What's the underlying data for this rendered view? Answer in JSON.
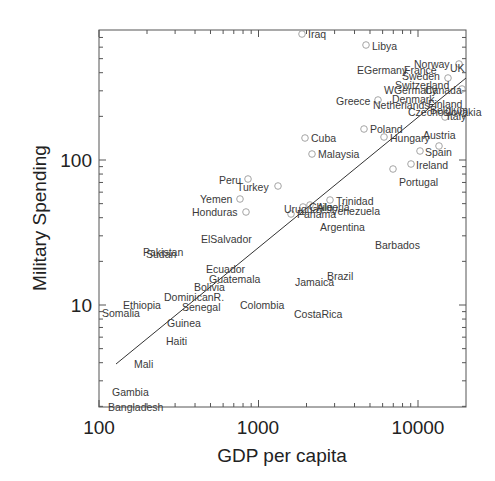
{
  "chart_data": {
    "type": "scatter",
    "title": "",
    "xlabel": "GDP per capita",
    "ylabel": "Military Spending",
    "xscale": "log",
    "yscale": "log",
    "xlim": [
      100,
      20000
    ],
    "ylim": [
      2,
      790
    ],
    "xticks": [
      100,
      1000,
      10000
    ],
    "xtick_labels": [
      "100",
      "1000",
      "10000"
    ],
    "yticks": [
      10,
      100
    ],
    "ytick_labels": [
      "10",
      "100"
    ],
    "grid": false,
    "legend": null,
    "fit_line": {
      "x": [
        126,
        20000
      ],
      "y": [
        4,
        245
      ]
    },
    "points": [
      {
        "label": "Iraq",
        "gdp": 1950,
        "mil": 780,
        "marker": true
      },
      {
        "label": "Libya",
        "gdp": 4900,
        "mil": 580,
        "marker": true
      },
      {
        "label": "EGermany",
        "gdp": 8500,
        "mil": 390,
        "marker": false
      },
      {
        "label": "Norway",
        "gdp": 14000,
        "mil": 420,
        "marker": false
      },
      {
        "label": "France",
        "gdp": 12000,
        "mil": 380,
        "marker": false
      },
      {
        "label": "UK",
        "gdp": 17000,
        "mil": 390,
        "marker": true
      },
      {
        "label": "Sweden",
        "gdp": 15500,
        "mil": 350,
        "marker": true
      },
      {
        "label": "Switzerland",
        "gdp": 16000,
        "mil": 310,
        "marker": false
      },
      {
        "label": "WGermany",
        "gdp": 13000,
        "mil": 290,
        "marker": false
      },
      {
        "label": "Canada",
        "gdp": 17500,
        "mil": 285,
        "marker": true
      },
      {
        "label": "Greece",
        "gdp": 6000,
        "mil": 250,
        "marker": true
      },
      {
        "label": "Denmark",
        "gdp": 13000,
        "mil": 255,
        "marker": false
      },
      {
        "label": "Netherlands",
        "gdp": 11500,
        "mil": 230,
        "marker": false
      },
      {
        "label": "Finland",
        "gdp": 14500,
        "mil": 225,
        "marker": false
      },
      {
        "label": "Czechoslovakia",
        "gdp": 12000,
        "mil": 215,
        "marker": false
      },
      {
        "label": "Belgium",
        "gdp": 15000,
        "mil": 210,
        "marker": false
      },
      {
        "label": "Italy",
        "gdp": 15500,
        "mil": 195,
        "marker": true
      },
      {
        "label": "Poland",
        "gdp": 4800,
        "mil": 165,
        "marker": true
      },
      {
        "label": "Hungary",
        "gdp": 6800,
        "mil": 150,
        "marker": true
      },
      {
        "label": "Austria",
        "gdp": 13500,
        "mil": 125,
        "marker": true
      },
      {
        "label": "Cuba",
        "gdp": 1980,
        "mil": 145,
        "marker": true
      },
      {
        "label": "Malaysia",
        "gdp": 2200,
        "mil": 112,
        "marker": true
      },
      {
        "label": "Spain",
        "gdp": 10500,
        "mil": 115,
        "marker": true
      },
      {
        "label": "Ireland",
        "gdp": 9300,
        "mil": 95,
        "marker": true
      },
      {
        "label": "Portugal",
        "gdp": 7200,
        "mil": 88,
        "marker": true
      },
      {
        "label": "Peru",
        "gdp": 860,
        "mil": 75,
        "marker": true
      },
      {
        "label": "Turkey",
        "gdp": 1350,
        "mil": 67,
        "marker": true
      },
      {
        "label": "Yemen",
        "gdp": 780,
        "mil": 55,
        "marker": true
      },
      {
        "label": "Honduras",
        "gdp": 850,
        "mil": 44,
        "marker": true
      },
      {
        "label": "Uruguay",
        "gdp": 2100,
        "mil": 50,
        "marker": true
      },
      {
        "label": "Chile",
        "gdp": 2250,
        "mil": 49,
        "marker": true
      },
      {
        "label": "Algeria",
        "gdp": 2400,
        "mil": 50,
        "marker": false
      },
      {
        "label": "Panama",
        "gdp": 1650,
        "mil": 43,
        "marker": true
      },
      {
        "label": "Trinidad",
        "gdp": 2900,
        "mil": 53,
        "marker": true
      },
      {
        "label": "Venezuela",
        "gdp": 2700,
        "mil": 47,
        "marker": false
      },
      {
        "label": "Argentina",
        "gdp": 2700,
        "mil": 36,
        "marker": false
      },
      {
        "label": "ElSalvador",
        "gdp": 650,
        "mil": 29,
        "marker": false
      },
      {
        "label": "Barbados",
        "gdp": 5000,
        "mil": 27,
        "marker": false
      },
      {
        "label": "Pakistan",
        "gdp": 180,
        "mil": 22,
        "marker": false
      },
      {
        "label": "Sudan",
        "gdp": 185,
        "mil": 21,
        "marker": false
      },
      {
        "label": "Ecuador",
        "gdp": 600,
        "mil": 16,
        "marker": false
      },
      {
        "label": "Guatemala",
        "gdp": 650,
        "mil": 14,
        "marker": false
      },
      {
        "label": "Bolivia",
        "gdp": 460,
        "mil": 13,
        "marker": false
      },
      {
        "label": "DominicanR.",
        "gdp": 400,
        "mil": 11,
        "marker": false
      },
      {
        "label": "Brazil",
        "gdp": 2950,
        "mil": 14.5,
        "marker": false
      },
      {
        "label": "Jamaica",
        "gdp": 1850,
        "mil": 14,
        "marker": false
      },
      {
        "label": "Ethiopia",
        "gdp": 150,
        "mil": 10,
        "marker": false
      },
      {
        "label": "Senegal",
        "gdp": 390,
        "mil": 9.5,
        "marker": false
      },
      {
        "label": "Colombia",
        "gdp": 900,
        "mil": 10,
        "marker": false
      },
      {
        "label": "Somalia",
        "gdp": 100,
        "mil": 9,
        "marker": false
      },
      {
        "label": "CostaRica",
        "gdp": 1800,
        "mil": 9,
        "marker": false
      },
      {
        "label": "Guinea",
        "gdp": 250,
        "mil": 7,
        "marker": false
      },
      {
        "label": "Haiti",
        "gdp": 260,
        "mil": 5.3,
        "marker": false
      },
      {
        "label": "Mali",
        "gdp": 180,
        "mil": 3.8,
        "marker": false
      },
      {
        "label": "Gambia",
        "gdp": 160,
        "mil": 2.6,
        "marker": false
      },
      {
        "label": "Bangladesh",
        "gdp": 150,
        "mil": 2.0,
        "marker": false
      }
    ]
  },
  "labels": [
    {
      "text": "Iraq",
      "x": 308,
      "y": 38
    },
    {
      "text": "Libya",
      "x": 372,
      "y": 50
    },
    {
      "text": "EGermany",
      "x": 357,
      "y": 74
    },
    {
      "text": "Norway",
      "x": 414,
      "y": 68
    },
    {
      "text": "France",
      "x": 404,
      "y": 74
    },
    {
      "text": "UK",
      "x": 450,
      "y": 72
    },
    {
      "text": "Sweden",
      "x": 402,
      "y": 80
    },
    {
      "text": "Switzerland",
      "x": 395,
      "y": 89
    },
    {
      "text": "WGermany",
      "x": 384,
      "y": 94
    },
    {
      "text": "Canada",
      "x": 425,
      "y": 94
    },
    {
      "text": "Greece",
      "x": 336,
      "y": 105
    },
    {
      "text": "Denmark",
      "x": 392,
      "y": 103
    },
    {
      "text": "Netherlands",
      "x": 373,
      "y": 109
    },
    {
      "text": "Finland",
      "x": 428,
      "y": 108
    },
    {
      "text": "Czechoslovakia",
      "x": 408,
      "y": 116
    },
    {
      "text": "Belgium",
      "x": 430,
      "y": 114
    },
    {
      "text": "Italy",
      "x": 447,
      "y": 120
    },
    {
      "text": "Poland",
      "x": 370,
      "y": 133
    },
    {
      "text": "Hungary",
      "x": 390,
      "y": 142
    },
    {
      "text": "Austria",
      "x": 423,
      "y": 139
    },
    {
      "text": "Cuba",
      "x": 311,
      "y": 142
    },
    {
      "text": "Malaysia",
      "x": 318,
      "y": 158
    },
    {
      "text": "Spain",
      "x": 425,
      "y": 156
    },
    {
      "text": "Ireland",
      "x": 416,
      "y": 169
    },
    {
      "text": "Portugal",
      "x": 399,
      "y": 186
    },
    {
      "text": "Peru",
      "x": 219,
      "y": 184
    },
    {
      "text": "Turkey",
      "x": 237,
      "y": 191
    },
    {
      "text": "Yemen",
      "x": 200,
      "y": 203
    },
    {
      "text": "Honduras",
      "x": 192,
      "y": 216
    },
    {
      "text": "Uruguay",
      "x": 284,
      "y": 213
    },
    {
      "text": "Chile",
      "x": 309,
      "y": 211
    },
    {
      "text": "Algeria",
      "x": 317,
      "y": 211
    },
    {
      "text": "Panama",
      "x": 297,
      "y": 218
    },
    {
      "text": "Trinidad",
      "x": 336,
      "y": 205
    },
    {
      "text": "Venezuela",
      "x": 331,
      "y": 215
    },
    {
      "text": "Argentina",
      "x": 320,
      "y": 231
    },
    {
      "text": "ElSalvador",
      "x": 201,
      "y": 243
    },
    {
      "text": "Barbados",
      "x": 375,
      "y": 249
    },
    {
      "text": "Pakistan",
      "x": 143,
      "y": 256
    },
    {
      "text": "Sudan",
      "x": 146,
      "y": 258
    },
    {
      "text": "Ecuador",
      "x": 206,
      "y": 273
    },
    {
      "text": "Guatemala",
      "x": 209,
      "y": 283
    },
    {
      "text": "Bolivia",
      "x": 194,
      "y": 291
    },
    {
      "text": "DominicanR.",
      "x": 164,
      "y": 301
    },
    {
      "text": "Brazil",
      "x": 327,
      "y": 280
    },
    {
      "text": "Jamaica",
      "x": 295,
      "y": 286
    },
    {
      "text": "Ethiopia",
      "x": 123,
      "y": 309
    },
    {
      "text": "Senegal",
      "x": 182,
      "y": 311
    },
    {
      "text": "Colombia",
      "x": 240,
      "y": 309
    },
    {
      "text": "Somalia",
      "x": 102,
      "y": 317
    },
    {
      "text": "CostaRica",
      "x": 294,
      "y": 318
    },
    {
      "text": "Guinea",
      "x": 167,
      "y": 327
    },
    {
      "text": "Haiti",
      "x": 166,
      "y": 345
    },
    {
      "text": "Mali",
      "x": 134,
      "y": 368
    },
    {
      "text": "Gambia",
      "x": 112,
      "y": 396
    },
    {
      "text": "Bangladesh",
      "x": 108,
      "y": 411
    }
  ],
  "markers": [
    {
      "name": "Iraq",
      "x": 302,
      "y": 34
    },
    {
      "name": "Libya",
      "x": 366,
      "y": 45
    },
    {
      "name": "UK",
      "x": 459,
      "y": 64
    },
    {
      "name": "Sweden",
      "x": 448,
      "y": 78
    },
    {
      "name": "Canada",
      "x": 462,
      "y": 89
    },
    {
      "name": "Greece",
      "x": 378,
      "y": 100
    },
    {
      "name": "Italy",
      "x": 445,
      "y": 117
    },
    {
      "name": "Poland",
      "x": 364,
      "y": 129
    },
    {
      "name": "Hungary",
      "x": 384,
      "y": 137
    },
    {
      "name": "Cuba",
      "x": 305,
      "y": 138
    },
    {
      "name": "Malaysia",
      "x": 312,
      "y": 154
    },
    {
      "name": "Spain",
      "x": 420,
      "y": 151
    },
    {
      "name": "Austria",
      "x": 439,
      "y": 146
    },
    {
      "name": "Ireland",
      "x": 411,
      "y": 164
    },
    {
      "name": "Portugal",
      "x": 393,
      "y": 169
    },
    {
      "name": "Peru",
      "x": 248,
      "y": 179
    },
    {
      "name": "Turkey",
      "x": 278,
      "y": 186
    },
    {
      "name": "Yemen",
      "x": 240,
      "y": 199
    },
    {
      "name": "Honduras",
      "x": 246,
      "y": 212
    },
    {
      "name": "Uruguay",
      "x": 303,
      "y": 207
    },
    {
      "name": "Chile",
      "x": 310,
      "y": 205
    },
    {
      "name": "Panama",
      "x": 291,
      "y": 214
    },
    {
      "name": "Trinidad",
      "x": 330,
      "y": 200
    }
  ],
  "fit_line": {
    "x1": 116,
    "y1": 364,
    "x2": 466,
    "y2": 78
  },
  "axes": {
    "frame": {
      "left": 99,
      "top": 30,
      "right": 466,
      "bottom": 407
    },
    "x_title": "GDP per capita",
    "y_title": "Military Spending",
    "x_tick_labels": [
      {
        "text": "100",
        "x": 99
      },
      {
        "text": "1000",
        "x": 258
      },
      {
        "text": "10000",
        "x": 418
      }
    ],
    "y_tick_labels": [
      {
        "text": "100",
        "y": 160
      },
      {
        "text": "10",
        "y": 305
      }
    ]
  }
}
